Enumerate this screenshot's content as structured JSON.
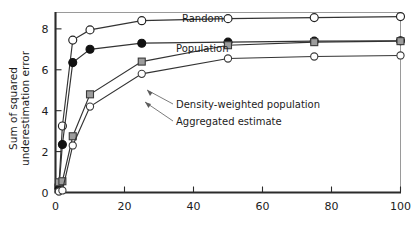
{
  "chart_data": {
    "type": "line",
    "title": "",
    "xlabel": "",
    "ylabel": "Sum of squared underestimation error",
    "xlim": [
      0,
      100
    ],
    "ylim": [
      0,
      8.8
    ],
    "xticks": [
      0,
      20,
      40,
      60,
      80,
      100
    ],
    "yticks": [
      0,
      2,
      4,
      6,
      8
    ],
    "xticklabels": [
      "0",
      "20",
      "40",
      "60",
      "80",
      "100"
    ],
    "yticklabels": [
      "0",
      "2",
      "4",
      "6",
      "8"
    ],
    "grid": false,
    "legend_position": "inline-annotations",
    "x": [
      1,
      2,
      5,
      10,
      25,
      50,
      75,
      100
    ],
    "series": [
      {
        "name": "Random",
        "marker": "open-circle",
        "values": [
          0.35,
          3.25,
          7.45,
          7.95,
          8.4,
          8.5,
          8.55,
          8.6
        ]
      },
      {
        "name": "Population",
        "marker": "filled-circle",
        "values": [
          0.2,
          2.35,
          6.35,
          7.0,
          7.3,
          7.35,
          7.4,
          7.42
        ]
      },
      {
        "name": "Density-weighted population",
        "marker": "filled-square",
        "values": [
          0.5,
          0.55,
          2.75,
          4.8,
          6.4,
          7.2,
          7.35,
          7.4
        ]
      },
      {
        "name": "Aggregated estimate",
        "marker": "open-diamond",
        "values": [
          0.05,
          0.1,
          2.3,
          4.2,
          5.8,
          6.55,
          6.65,
          6.7
        ]
      }
    ],
    "annotations": [
      {
        "text": "Random",
        "target_series": "Random"
      },
      {
        "text": "Population",
        "target_series": "Population"
      },
      {
        "text": "Density-weighted population",
        "target_series": "Density-weighted population"
      },
      {
        "text": "Aggregated estimate",
        "target_series": "Aggregated estimate"
      }
    ]
  },
  "axes": {
    "y_title": "Sum of squared underestimation error"
  }
}
